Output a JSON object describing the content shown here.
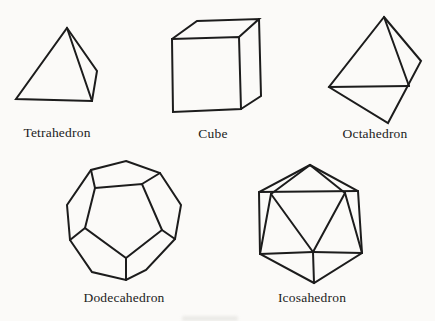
{
  "figure": {
    "solids": [
      {
        "id": "tetrahedron",
        "label": "Tetrahedron"
      },
      {
        "id": "cube",
        "label": "Cube"
      },
      {
        "id": "octahedron",
        "label": "Octahedron"
      },
      {
        "id": "dodecahedron",
        "label": "Dodecahedron"
      },
      {
        "id": "icosahedron",
        "label": "Icosahedron"
      }
    ],
    "colors": {
      "ink": "#1c1c1c",
      "paper": "#fbfaf8"
    }
  }
}
